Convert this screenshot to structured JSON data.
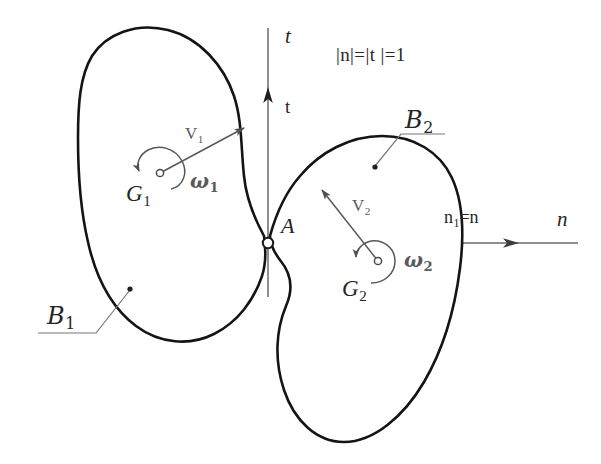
{
  "figure": {
    "background_color": "#ffffff",
    "body_stroke_color": "#141414",
    "axis_color": "#6b6b6b",
    "vector_color": "#585858",
    "text_color": "#2b2b2b",
    "width": 601,
    "height": 464
  },
  "axes": {
    "normal_axis": {
      "name": "n",
      "label": "n",
      "tick_label": "n",
      "relation_label": "n₁=n",
      "relation_sub": "1",
      "relation_rest": "=n",
      "direction": "right",
      "y": 243,
      "x_start": 112,
      "x_end": 578,
      "arrow_x": 518
    },
    "tangent_axis": {
      "name": "t",
      "label": "t",
      "vector_label": "t",
      "direction": "up",
      "x": 268,
      "y_start": 297,
      "y_end": 28,
      "arrow_y": 88
    },
    "unit_note": "|n|=|t |=1"
  },
  "contact": {
    "point_label": "A",
    "x": 268,
    "y": 243,
    "marker": "open-circle"
  },
  "bodies": [
    {
      "id": "body-1",
      "label": "B",
      "label_sub": "1",
      "centroid_label": "G",
      "centroid_sub": "1",
      "centroid_x": 160,
      "centroid_y": 173,
      "velocity_label": "V",
      "velocity_sub": "1",
      "velocity_direction": "up-right",
      "angular_label": "ω",
      "angular_sub": "1",
      "angular_sense": "counterclockwise",
      "leader_dot_x": 130,
      "leader_dot_y": 289
    },
    {
      "id": "body-2",
      "label": "B",
      "label_sub": "2",
      "centroid_label": "G",
      "centroid_sub": "2",
      "centroid_x": 378,
      "centroid_y": 261,
      "velocity_label": "V",
      "velocity_sub": "2",
      "velocity_direction": "up-left",
      "angular_label": "ω",
      "angular_sub": "2",
      "angular_sense": "counterclockwise",
      "leader_dot_x": 375,
      "leader_dot_y": 167
    }
  ]
}
